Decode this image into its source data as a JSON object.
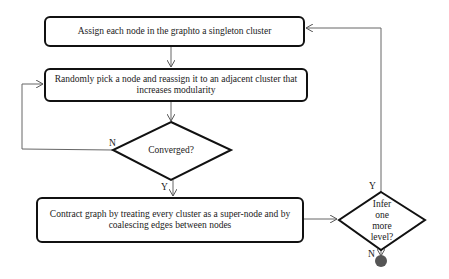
{
  "diagram": {
    "type": "flowchart",
    "nodes": {
      "assign": {
        "label": "Assign each node in the graphto a singleton cluster",
        "shape": "rounded-rect"
      },
      "reassign": {
        "label": "Randomly pick a node and reassign it to an adjacent cluster that increases modularity",
        "shape": "rounded-rect"
      },
      "converged": {
        "label": "Converged?",
        "shape": "diamond"
      },
      "contract": {
        "label": "Contract graph by treating every cluster as a super-node and by coalescing edges between nodes",
        "shape": "rounded-rect"
      },
      "infer": {
        "label_lines": [
          "Infer",
          "one",
          "more",
          "level?"
        ],
        "shape": "diamond"
      },
      "end": {
        "shape": "filled-circle",
        "color": "#555555"
      }
    },
    "edges": {
      "converged_no": "N",
      "converged_yes": "Y",
      "infer_yes": "Y",
      "infer_no": "N"
    },
    "colors": {
      "stroke": "#111111",
      "line": "#666666",
      "end": "#555555"
    }
  }
}
